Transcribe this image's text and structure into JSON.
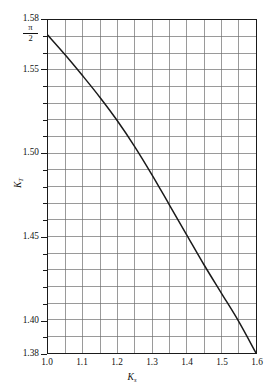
{
  "figure": {
    "background_color": "#ffffff",
    "axis_color": "#1a1a1a",
    "grid_color": "#6d6d6d",
    "curve_color": "#1a1a1a"
  },
  "axes": {
    "x_title_main": "K",
    "x_title_sub": "s",
    "y_title_main": "K",
    "y_title_sub": "T",
    "x_min": 1.0,
    "x_max": 1.6,
    "y_min": 1.38,
    "y_max": 1.58,
    "x_tick_labels": [
      "1.0",
      "1.1",
      "1.2",
      "1.3",
      "1.4",
      "1.5",
      "1.6"
    ],
    "x_tick_values": [
      1.0,
      1.1,
      1.2,
      1.3,
      1.4,
      1.5,
      1.6
    ],
    "y_tick_labels": [
      "1.58",
      "1.55",
      "1.50",
      "1.45",
      "1.40",
      "1.38"
    ],
    "y_tick_values": [
      1.58,
      1.55,
      1.5,
      1.45,
      1.4,
      1.38
    ],
    "special_y_label": {
      "numerator": "π",
      "denominator": "2",
      "value": 1.5708
    },
    "x_minor_step": 0.05,
    "y_minor_step": 0.01
  },
  "chart_data": {
    "type": "line",
    "title": "",
    "subtitle": "",
    "xlabel": "K_s",
    "ylabel": "K_T",
    "xlim": [
      1.0,
      1.6
    ],
    "ylim": [
      1.38,
      1.58
    ],
    "grid": true,
    "legend": null,
    "x_ticks": [
      1.0,
      1.1,
      1.2,
      1.3,
      1.4,
      1.5,
      1.6
    ],
    "y_ticks": [
      1.38,
      1.4,
      1.45,
      1.5,
      1.55,
      1.58
    ],
    "annotations": [
      {
        "text": "π/2",
        "axis": "y",
        "value": 1.5708
      }
    ],
    "series": [
      {
        "name": "K_T vs K_s",
        "x": [
          1.0,
          1.05,
          1.1,
          1.15,
          1.2,
          1.25,
          1.3,
          1.35,
          1.4,
          1.45,
          1.5,
          1.55,
          1.6
        ],
        "y": [
          1.5708,
          1.559,
          1.5465,
          1.5335,
          1.5195,
          1.504,
          1.487,
          1.469,
          1.451,
          1.433,
          1.416,
          1.399,
          1.38
        ]
      }
    ]
  }
}
